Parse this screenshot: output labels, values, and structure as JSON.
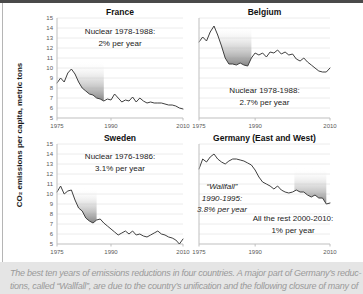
{
  "figure": {
    "y_axis_label": "CO₂ emissions per capita, metric tons"
  },
  "caption": {
    "lines": [
      "The best ten years of emissions reductions in four countries. A major part of Germany’s reduc-",
      "tions, called “Wallfall”, are due to the country’s unification and the following closure of many of"
    ]
  },
  "colors": {
    "line": "#3f3f3f",
    "grid": "#ececec",
    "axis": "#bfbfbf",
    "tick_text": "#595959",
    "band_gradient_dark": "#7d7d7d",
    "band_gradient_mid": "#b9b9b9",
    "top_bar": "#4a4a4a",
    "caption_background": "#e5e5e5",
    "caption_text": "#9a9a9a",
    "title_text": "#1a1a1a"
  },
  "chart_data": [
    {
      "type": "line",
      "title": "France",
      "x_range": [
        1975,
        2010
      ],
      "x_ticks": [
        1975,
        1990,
        2010
      ],
      "ylim": [
        5,
        15
      ],
      "y_tick_step": 1,
      "values": [
        8.5,
        9.0,
        8.6,
        9.5,
        9.9,
        9.4,
        8.6,
        8.0,
        7.7,
        7.4,
        7.3,
        7.0,
        6.9,
        6.7,
        6.9,
        6.8,
        7.4,
        7.0,
        6.6,
        6.8,
        6.7,
        7.1,
        6.6,
        7.0,
        6.7,
        6.5,
        6.6,
        6.5,
        6.5,
        6.5,
        6.4,
        6.3,
        6.3,
        6.2,
        6.0,
        5.9
      ],
      "highlight_band": {
        "x_from": 1979.5,
        "x_to": 1988,
        "y_top": 10.7
      },
      "annotations": [
        {
          "lines": [
            "Nuclear 1978-1988:",
            "2% per year"
          ],
          "italic": false
        }
      ]
    },
    {
      "type": "line",
      "title": "Belgium",
      "x_range": [
        1975,
        2010
      ],
      "x_ticks": [
        1975,
        1990,
        2010
      ],
      "ylim": [
        5,
        15
      ],
      "y_tick_step": 1,
      "values": [
        12.6,
        13.1,
        12.7,
        13.6,
        14.2,
        13.3,
        12.2,
        11.0,
        10.4,
        10.4,
        10.3,
        10.5,
        10.3,
        10.2,
        11.0,
        11.5,
        11.3,
        11.5,
        11.1,
        11.6,
        11.5,
        11.8,
        11.4,
        11.6,
        11.3,
        11.4,
        10.9,
        10.7,
        11.0,
        10.6,
        10.3,
        10.0,
        9.7,
        9.6,
        9.6,
        10.0
      ],
      "highlight_band": {
        "x_from": 1979.8,
        "x_to": 1989,
        "y_top": 14.2
      },
      "annotations": [
        {
          "lines": [
            "Nuclear 1978-1988:",
            "2.7% per year"
          ],
          "italic": false
        }
      ]
    },
    {
      "type": "line",
      "title": "Sweden",
      "x_range": [
        1975,
        2010
      ],
      "x_ticks": [
        1975,
        1990,
        2010
      ],
      "ylim": [
        5,
        15
      ],
      "y_tick_step": 1,
      "values": [
        10.2,
        10.8,
        10.0,
        10.3,
        10.4,
        9.4,
        8.6,
        8.3,
        7.6,
        7.3,
        7.1,
        7.4,
        7.5,
        7.1,
        6.8,
        6.5,
        6.2,
        5.9,
        6.1,
        6.3,
        6.0,
        6.3,
        5.9,
        6.0,
        5.8,
        5.7,
        5.9,
        6.1,
        6.3,
        6.0,
        5.9,
        5.7,
        5.6,
        5.4,
        5.0,
        5.5
      ],
      "highlight_band": {
        "x_from": 1976.5,
        "x_to": 1986,
        "y_top": 10.6
      },
      "annotations": [
        {
          "lines": [
            "Nuclear 1976-1986:",
            "3.1% per year"
          ],
          "italic": false
        }
      ]
    },
    {
      "type": "line",
      "title": "Germany (East and West)",
      "x_range": [
        1975,
        2010
      ],
      "x_ticks": [
        1975,
        1990,
        2010
      ],
      "ylim": [
        5,
        15
      ],
      "y_tick_step": 1,
      "values": [
        12.5,
        13.5,
        13.2,
        13.7,
        14.0,
        13.5,
        13.2,
        13.0,
        13.3,
        13.5,
        13.5,
        13.4,
        13.3,
        13.1,
        12.9,
        12.4,
        11.7,
        11.2,
        11.0,
        10.8,
        10.5,
        10.8,
        10.4,
        10.2,
        10.1,
        10.2,
        10.4,
        10.2,
        10.2,
        9.9,
        9.7,
        9.9,
        9.6,
        9.6,
        9.0,
        9.1
      ],
      "highlight_band": {
        "x_from": 2000.5,
        "x_to": 2009,
        "y_top": 12.6
      },
      "annotations": [
        {
          "lines": [
            "“Wallfall”",
            "1990-1995:",
            "3.8% per year"
          ],
          "italic": true
        },
        {
          "lines": [
            "All the rest 2000-2010:",
            "1% per year"
          ],
          "italic": false
        }
      ]
    }
  ]
}
